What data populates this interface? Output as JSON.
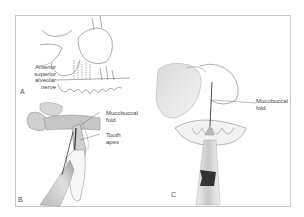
{
  "figure": {
    "panels": [
      {
        "id": "A",
        "letter": "A",
        "labels": [
          {
            "id": "anterior-superior-alveolar-nerve",
            "text": "Anterior\nsuperior\nalveolar\nnerve"
          }
        ]
      },
      {
        "id": "B",
        "letter": "B",
        "labels": [
          {
            "id": "mucobuccal-fold",
            "text": "Mucobuccal\nfold"
          },
          {
            "id": "tooth-apex",
            "text": "Tooth\napex"
          }
        ]
      },
      {
        "id": "C",
        "letter": "C",
        "labels": [
          {
            "id": "mucobuccal-fold",
            "text": "Mucobuccal\nfold"
          }
        ]
      }
    ],
    "colors": {
      "frame": "#c9c9c9",
      "line_art": "#6a6a6a",
      "shading_light": "#e2e2e2",
      "shading_mid": "#bdbdbd",
      "shading_dark": "#444444",
      "label_text": "#444444"
    }
  }
}
